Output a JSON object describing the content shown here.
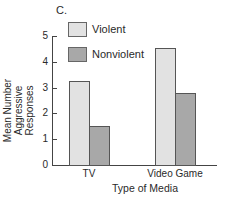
{
  "panel_label": "C.",
  "colors": {
    "violent": "#e2e2e2",
    "nonviolent": "#a8a8a8",
    "axis": "#444444"
  },
  "chart_data": {
    "type": "bar",
    "title": "",
    "panel": "C.",
    "categories": [
      "TV",
      "Video Game"
    ],
    "series": [
      {
        "name": "Violent",
        "values": [
          3.25,
          4.55
        ]
      },
      {
        "name": "Nonviolent",
        "values": [
          1.5,
          2.8
        ]
      }
    ],
    "xlabel": "Type of Media",
    "ylabel": "Mean Number Aggressive Responses",
    "ylim": [
      0,
      5
    ],
    "yticks": [
      "0",
      "1",
      "2",
      "3",
      "4",
      "5"
    ],
    "grid": false,
    "legend_position": "upper left"
  },
  "legend": {
    "items": [
      {
        "label": "Violent"
      },
      {
        "label": "Nonviolent"
      }
    ]
  },
  "axes": {
    "ylabel_line1": "Mean Number Aggressive",
    "ylabel_line2": "Responses"
  }
}
